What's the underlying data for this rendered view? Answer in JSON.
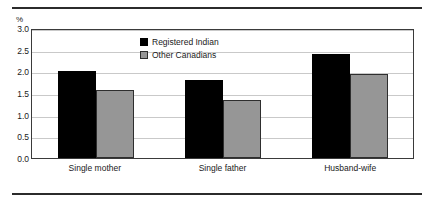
{
  "chart_data": {
    "type": "bar",
    "title": "",
    "subtitle": "",
    "xlabel": "",
    "ylabel": "%",
    "unit_label": "%",
    "categories": [
      "Single mother",
      "Single father",
      "Husband-wife"
    ],
    "series": [
      {
        "name": "Registered Indian",
        "color": "#000000",
        "values": [
          2.0,
          1.8,
          2.4
        ]
      },
      {
        "name": "Other Canadians",
        "color": "#969696",
        "values": [
          1.58,
          1.35,
          1.95
        ]
      }
    ],
    "ylim": [
      0.0,
      3.0
    ],
    "yticks": [
      "3.0",
      "2.5",
      "2.0",
      "1.5",
      "1.0",
      "0.5",
      "0.0"
    ],
    "ytick_values": [
      3.0,
      2.5,
      2.0,
      1.5,
      1.0,
      0.5,
      0.0
    ],
    "grid": true,
    "legend_position": "inside-top-center"
  },
  "legend": {
    "items": [
      {
        "label": "Registered Indian"
      },
      {
        "label": "Other Canadians"
      }
    ]
  },
  "colors": {
    "series_0": "#000000",
    "series_1": "#969696",
    "gridline": "#c9c9c9",
    "axis": "#3a3a3a",
    "rule": "#2b2b2b"
  }
}
